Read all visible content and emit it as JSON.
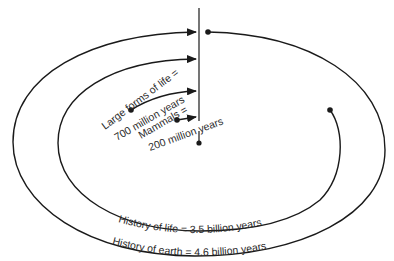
{
  "diagram": {
    "type": "spiral-timeline",
    "labels": {
      "large_forms_line1": "Large forms of life =",
      "large_forms_line2": "700 million years",
      "mammals_line1": "Mammals =",
      "mammals_line2": "200 million years",
      "history_of_life": "History of life = 3.5 billion years",
      "history_of_earth": "History of earth = 4.6 billion years"
    },
    "colors": {
      "stroke": "#1a1a1a",
      "background": "#ffffff",
      "text": "#2a2a2a"
    }
  }
}
